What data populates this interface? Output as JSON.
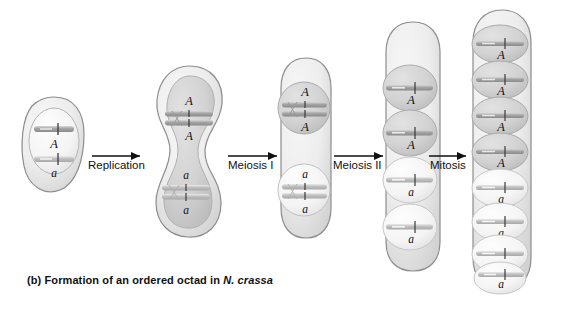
{
  "figure": {
    "caption_prefix": "(b) Formation of an ordered octad in ",
    "caption_species": "N. crassa",
    "background_color": "#ffffff",
    "cell_fill_light": "#f0f0f0",
    "cell_fill_mid": "#dcdcdc",
    "cell_fill_dark": "#cfcfcf",
    "outline_color": "#8d8d8d",
    "chromosome_color": "#9a9a9a",
    "label_color": "#111111"
  },
  "arrows": [
    {
      "label": "Replication"
    },
    {
      "label": "Meiosis I"
    },
    {
      "label": "Meiosis II"
    },
    {
      "label": "Mitosis"
    }
  ],
  "stages": [
    {
      "name": "parent-cell",
      "label": "Parent cell",
      "nuclei": 1,
      "chromosomes": [
        {
          "allele": "A",
          "shaded": true
        },
        {
          "allele": "a",
          "shaded": false
        }
      ]
    },
    {
      "name": "replicated-cell",
      "label": "Replicated cell",
      "nuclei": 1,
      "chromosomes": [
        {
          "allele": "A",
          "shaded": true
        },
        {
          "allele": "A",
          "shaded": true
        },
        {
          "allele": "a",
          "shaded": false
        },
        {
          "allele": "a",
          "shaded": false
        }
      ]
    },
    {
      "name": "meiosis-one-product",
      "label": "Two cells after meiosis I",
      "nuclei": 2,
      "chromosomes": [
        {
          "allele": "A",
          "shaded": true
        },
        {
          "allele": "A",
          "shaded": true
        },
        {
          "allele": "a",
          "shaded": false
        },
        {
          "allele": "a",
          "shaded": false
        }
      ]
    },
    {
      "name": "meiosis-two-product",
      "label": "Four cells after meiosis II",
      "nuclei": 4,
      "chromosomes": [
        {
          "allele": "A",
          "shaded": true
        },
        {
          "allele": "A",
          "shaded": true
        },
        {
          "allele": "a",
          "shaded": false
        },
        {
          "allele": "a",
          "shaded": false
        }
      ]
    },
    {
      "name": "ordered-octad",
      "label": "Ordered octad after mitosis",
      "nuclei": 8,
      "chromosomes": [
        {
          "allele": "A",
          "shaded": true
        },
        {
          "allele": "A",
          "shaded": true
        },
        {
          "allele": "A",
          "shaded": true
        },
        {
          "allele": "A",
          "shaded": true
        },
        {
          "allele": "a",
          "shaded": false
        },
        {
          "allele": "a",
          "shaded": false
        },
        {
          "allele": "a",
          "shaded": false
        },
        {
          "allele": "a",
          "shaded": false
        }
      ]
    }
  ]
}
